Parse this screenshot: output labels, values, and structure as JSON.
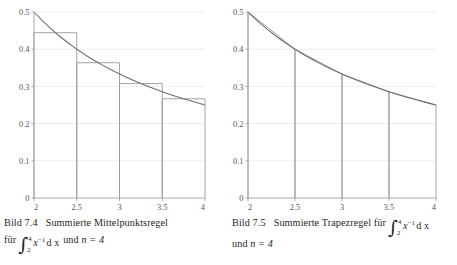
{
  "page": {
    "background": "#ffffff",
    "width": 457,
    "height": 265
  },
  "style": {
    "curve_color": "#6e6e6e",
    "rule_color": "#9a9a9a",
    "axis_color": "#a8a8a8",
    "grid_color": "#e8e8e8",
    "tick_label_color": "#555555"
  },
  "figures": [
    {
      "id": "figure-left",
      "caption": {
        "number": "Bild 7.4",
        "line1_text": "Summierte Mittelpunktsregel",
        "line2_prefix": "für",
        "integral": {
          "lower": "2",
          "upper": "4",
          "integrand": "x",
          "exponent": "−1",
          "differential": "d x"
        },
        "line2_suffix": "und",
        "n_label": "n = 4"
      }
    },
    {
      "id": "figure-right",
      "caption": {
        "number": "Bild 7.5",
        "line1_text": "Summierte   Trapezregel   für",
        "integral": {
          "lower": "2",
          "upper": "4",
          "integrand": "x",
          "exponent": "−1",
          "differential": "d x"
        },
        "line2_prefix": "und",
        "n_label": "n = 4"
      }
    }
  ],
  "chart_data": [
    {
      "type": "area",
      "id": "midpoint-rule-chart",
      "title": "Summierte Mittelpunktsregel",
      "function": "1/x",
      "xlabel": "",
      "ylabel": "",
      "xlim": [
        2,
        4
      ],
      "ylim": [
        0,
        0.5
      ],
      "grid": true,
      "legend_position": "none",
      "xticks": [
        2,
        2.5,
        3,
        3.5,
        4
      ],
      "xticklabels": [
        "2",
        "2.5",
        "3",
        "3.5",
        "4"
      ],
      "yticks": [
        0,
        0.1,
        0.2,
        0.3,
        0.4,
        0.5
      ],
      "yticklabels": [
        "0",
        "0.1",
        "0.2",
        "0.3",
        "0.4",
        "0.5"
      ],
      "n": 4,
      "rule": "midpoint",
      "curve": {
        "name": "f(x) = 1/x",
        "x": [
          2.0,
          2.1,
          2.2,
          2.3,
          2.4,
          2.5,
          2.6,
          2.7,
          2.8,
          2.9,
          3.0,
          3.1,
          3.2,
          3.3,
          3.4,
          3.5,
          3.6,
          3.7,
          3.8,
          3.9,
          4.0
        ],
        "y": [
          0.5,
          0.4762,
          0.4545,
          0.4348,
          0.4167,
          0.4,
          0.3846,
          0.3704,
          0.3571,
          0.3448,
          0.3333,
          0.3226,
          0.3125,
          0.303,
          0.2941,
          0.2857,
          0.2778,
          0.2703,
          0.2632,
          0.2564,
          0.25
        ]
      },
      "rectangles": [
        {
          "x_left": 2.0,
          "x_right": 2.5,
          "midpoint": 2.25,
          "height": 0.4444
        },
        {
          "x_left": 2.5,
          "x_right": 3.0,
          "midpoint": 2.75,
          "height": 0.3636
        },
        {
          "x_left": 3.0,
          "x_right": 3.5,
          "midpoint": 3.25,
          "height": 0.3077
        },
        {
          "x_left": 3.5,
          "x_right": 4.0,
          "midpoint": 3.75,
          "height": 0.2667
        }
      ]
    },
    {
      "type": "area",
      "id": "trapezoid-rule-chart",
      "title": "Summierte Trapezregel",
      "function": "1/x",
      "xlabel": "",
      "ylabel": "",
      "xlim": [
        2,
        4
      ],
      "ylim": [
        0,
        0.5
      ],
      "grid": true,
      "legend_position": "none",
      "xticks": [
        2,
        2.5,
        3,
        3.5,
        4
      ],
      "xticklabels": [
        "2",
        "2.5",
        "3",
        "3.5",
        "4"
      ],
      "yticks": [
        0,
        0.1,
        0.2,
        0.3,
        0.4,
        0.5
      ],
      "yticklabels": [
        "0",
        "0.1",
        "0.2",
        "0.3",
        "0.4",
        "0.5"
      ],
      "n": 4,
      "rule": "trapezoid",
      "curve": {
        "name": "f(x) = 1/x",
        "x": [
          2.0,
          2.1,
          2.2,
          2.3,
          2.4,
          2.5,
          2.6,
          2.7,
          2.8,
          2.9,
          3.0,
          3.1,
          3.2,
          3.3,
          3.4,
          3.5,
          3.6,
          3.7,
          3.8,
          3.9,
          4.0
        ],
        "y": [
          0.5,
          0.4762,
          0.4545,
          0.4348,
          0.4167,
          0.4,
          0.3846,
          0.3704,
          0.3571,
          0.3448,
          0.3333,
          0.3226,
          0.3125,
          0.303,
          0.2941,
          0.2857,
          0.2778,
          0.2703,
          0.2632,
          0.2564,
          0.25
        ]
      },
      "nodes": [
        {
          "x": 2.0,
          "y": 0.5
        },
        {
          "x": 2.5,
          "y": 0.4
        },
        {
          "x": 3.0,
          "y": 0.3333
        },
        {
          "x": 3.5,
          "y": 0.2857
        },
        {
          "x": 4.0,
          "y": 0.25
        }
      ]
    }
  ]
}
